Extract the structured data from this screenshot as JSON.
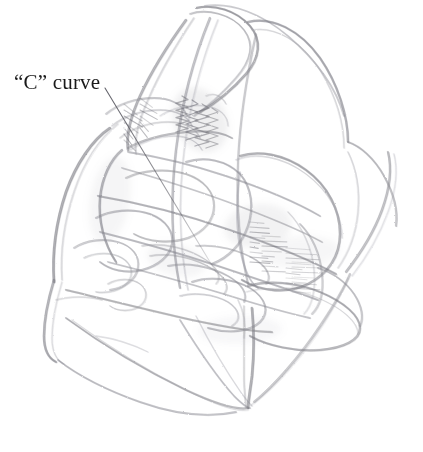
{
  "figure": {
    "type": "pencil-sketch",
    "medium": "graphite pencil on white paper",
    "background_color": "#ffffff",
    "stroke_colors": {
      "light": "#c9c9cf",
      "mid": "#9a9aa2",
      "dark": "#6a6a72",
      "darkest": "#55555d"
    }
  },
  "annotation": {
    "label": "“C” curve",
    "text_color": "#1a1a1a",
    "font_size_px": 21,
    "leader_line": {
      "from": [
        105,
        88
      ],
      "to": [
        216,
        272
      ],
      "color": "#5a5a62"
    }
  },
  "strokes": {
    "note": "Each entry is a graphite stroke path: d = SVG path, w = stroke width, o = opacity, c = color key",
    "paths": [
      {
        "d": "M196 8 C 214 4, 236 10, 250 26 C 262 40, 260 58, 246 74 C 232 90, 214 104, 200 112",
        "w": 2.1,
        "o": 0.55,
        "c": "#7a7a82"
      },
      {
        "d": "M190 14 C 206 8, 232 14, 244 30 C 256 46, 250 62, 236 78 C 222 94, 206 108, 194 116",
        "w": 1.6,
        "o": 0.45,
        "c": "#8a8a92"
      },
      {
        "d": "M205 6 C 232 2, 262 14, 288 36 C 316 60, 336 88, 344 116",
        "w": 1.8,
        "o": 0.4,
        "c": "#9a9aa2"
      },
      {
        "d": "M248 22 C 272 16, 300 30, 320 58 C 338 84, 348 116, 348 142",
        "w": 2.2,
        "o": 0.5,
        "c": "#7d7d85"
      },
      {
        "d": "M252 30 C 276 26, 302 42, 320 70 C 336 96, 344 124, 344 148",
        "w": 1.4,
        "o": 0.35,
        "c": "#a5a5ad"
      },
      {
        "d": "M186 20 C 170 42, 152 70, 140 96 C 130 118, 126 136, 128 150",
        "w": 2.4,
        "o": 0.5,
        "c": "#7b7b83"
      },
      {
        "d": "M194 18 C 178 42, 160 72, 148 100 C 138 122, 134 140, 136 154",
        "w": 1.5,
        "o": 0.38,
        "c": "#9b9ba3"
      },
      {
        "d": "M128 148 C 142 140, 164 134, 186 132 C 206 130, 222 132, 232 138",
        "w": 2.0,
        "o": 0.45,
        "c": "#84848c"
      },
      {
        "d": "M122 150 C 110 160, 102 178, 100 198 C 98 220, 104 244, 116 262",
        "w": 2.2,
        "o": 0.5,
        "c": "#7a7a82"
      },
      {
        "d": "M110 128 C 92 140, 76 164, 66 192 C 56 222, 52 254, 54 282",
        "w": 2.6,
        "o": 0.52,
        "c": "#77777f"
      },
      {
        "d": "M118 124 C 100 138, 84 162, 74 192 C 64 222, 60 252, 62 280",
        "w": 1.5,
        "o": 0.35,
        "c": "#9d9da5"
      },
      {
        "d": "M54 280 C 48 300, 44 320, 44 336 C 44 350, 48 358, 56 362",
        "w": 2.4,
        "o": 0.5,
        "c": "#7c7c84"
      },
      {
        "d": "M62 282 C 56 302, 52 322, 52 338 C 52 352, 56 360, 64 364",
        "w": 1.3,
        "o": 0.32,
        "c": "#a0a0a8"
      },
      {
        "d": "M58 360 C 76 374, 106 390, 140 402 C 174 414, 208 418, 236 412",
        "w": 1.9,
        "o": 0.42,
        "c": "#8b8b93"
      },
      {
        "d": "M66 318 C 96 340, 140 368, 186 390 C 216 404, 238 410, 248 408",
        "w": 2.0,
        "o": 0.45,
        "c": "#84848c"
      },
      {
        "d": "M72 320 C 102 342, 146 370, 190 392 C 218 406, 238 412, 248 410",
        "w": 1.2,
        "o": 0.3,
        "c": "#a8a8b0"
      },
      {
        "d": "M180 320 C 196 346, 216 376, 234 396 C 242 404, 248 408, 250 408",
        "w": 1.8,
        "o": 0.4,
        "c": "#8d8d95"
      },
      {
        "d": "M196 316 C 210 344, 228 374, 242 394 C 248 402, 252 406, 252 406",
        "w": 1.3,
        "o": 0.32,
        "c": "#a2a2aa"
      },
      {
        "d": "M252 308 C 254 330, 254 356, 252 376 C 250 392, 248 402, 248 408",
        "w": 2.6,
        "o": 0.5,
        "c": "#797981"
      },
      {
        "d": "M244 306 C 244 330, 244 356, 244 376 C 244 392, 246 402, 246 408",
        "w": 1.6,
        "o": 0.36,
        "c": "#9a9aa2"
      },
      {
        "d": "M254 402 C 274 386, 300 356, 320 326 C 336 302, 346 284, 350 274",
        "w": 2.0,
        "o": 0.42,
        "c": "#87878f"
      },
      {
        "d": "M250 406 C 270 392, 298 362, 318 332 C 334 308, 344 288, 348 278",
        "w": 1.3,
        "o": 0.3,
        "c": "#a4a4ac"
      },
      {
        "d": "M346 272 C 360 254, 374 232, 382 210 C 390 188, 392 168, 388 152",
        "w": 2.2,
        "o": 0.45,
        "c": "#82828a"
      },
      {
        "d": "M352 276 C 366 258, 380 234, 388 212 C 396 190, 398 170, 394 154",
        "w": 1.3,
        "o": 0.3,
        "c": "#a6a6ae"
      },
      {
        "d": "M348 142 C 360 146, 374 158, 384 176 C 394 194, 398 212, 396 226",
        "w": 2.0,
        "o": 0.42,
        "c": "#87878f"
      },
      {
        "d": "M128 152 C 154 156, 190 164, 226 176 C 262 188, 296 202, 320 216",
        "w": 2.0,
        "o": 0.4,
        "c": "#8a8a92"
      },
      {
        "d": "M122 168 C 150 176, 190 188, 228 202 C 266 216, 300 230, 322 242",
        "w": 1.8,
        "o": 0.38,
        "c": "#8e8e96"
      },
      {
        "d": "M98 196 C 134 202, 184 214, 230 230 C 276 246, 314 262, 336 274",
        "w": 2.2,
        "o": 0.45,
        "c": "#82828a"
      },
      {
        "d": "M100 232 C 132 240, 176 252, 218 266 C 260 280, 296 292, 318 300",
        "w": 2.0,
        "o": 0.42,
        "c": "#86868e"
      },
      {
        "d": "M108 262 C 140 270, 184 282, 224 294 C 262 306, 292 314, 310 318",
        "w": 1.8,
        "o": 0.4,
        "c": "#8c8c94"
      },
      {
        "d": "M66 290 C 100 298, 148 310, 192 320 C 230 328, 258 332, 272 332",
        "w": 2.2,
        "o": 0.44,
        "c": "#838389"
      },
      {
        "d": "M210 18 C 196 52, 182 100, 176 150 C 170 200, 172 248, 180 288",
        "w": 2.2,
        "o": 0.44,
        "c": "#81818a"
      },
      {
        "d": "M218 20 C 204 54, 190 102, 184 152 C 178 202, 180 250, 188 290",
        "w": 1.4,
        "o": 0.32,
        "c": "#a0a0a8"
      },
      {
        "d": "M256 34 C 248 70, 240 116, 238 162 C 236 208, 240 250, 248 284",
        "w": 1.9,
        "o": 0.4,
        "c": "#8a8a92"
      },
      {
        "d": "M240 156 C 258 150, 284 154, 306 170 C 328 186, 340 210, 340 234 C 340 256, 328 274, 308 284 C 288 294, 262 292, 242 280",
        "w": 2.3,
        "o": 0.48,
        "c": "#7c7c84"
      },
      {
        "d": "M236 160 C 254 152, 282 156, 306 174 C 330 192, 342 216, 342 238",
        "w": 1.4,
        "o": 0.32,
        "c": "#a2a2aa"
      },
      {
        "d": "M240 172 C 236 200, 236 232, 242 258 C 246 274, 252 284, 258 288",
        "w": 1.7,
        "o": 0.38,
        "c": "#90909a"
      },
      {
        "d": "M186 162 C 204 156, 226 160, 240 174 C 252 188, 254 208, 248 226 C 242 244, 228 258, 212 264",
        "w": 2.0,
        "o": 0.42,
        "c": "#86868e"
      },
      {
        "d": "M126 178 C 142 170, 166 168, 186 174 C 204 180, 214 192, 214 206 C 214 220, 204 232, 188 238 C 170 244, 148 242, 134 234",
        "w": 1.9,
        "o": 0.4,
        "c": "#89898f"
      },
      {
        "d": "M96 218 C 110 210, 132 208, 150 214 C 166 220, 174 232, 172 244 C 170 256, 158 266, 142 270 C 126 274, 110 270, 100 262",
        "w": 2.0,
        "o": 0.42,
        "c": "#86868e"
      },
      {
        "d": "M74 248 C 86 240, 104 238, 118 242 C 132 246, 140 256, 138 268 C 136 280, 124 288, 110 290",
        "w": 1.8,
        "o": 0.4,
        "c": "#8c8c94"
      },
      {
        "d": "M84 258 C 96 252, 112 252, 122 258 C 132 264, 134 274, 128 282 C 122 290, 108 294, 96 292",
        "w": 1.5,
        "o": 0.35,
        "c": "#989aa0"
      },
      {
        "d": "M108 284 C 118 278, 132 278, 140 284 C 148 290, 148 300, 140 306 C 132 312, 118 312, 110 306",
        "w": 1.5,
        "o": 0.35,
        "c": "#98989e"
      },
      {
        "d": "M248 286 C 268 280, 296 282, 320 292 C 344 302, 360 316, 360 328 C 360 340, 344 348, 320 350 C 296 352, 268 346, 250 336",
        "w": 2.2,
        "o": 0.46,
        "c": "#7e7e86"
      },
      {
        "d": "M246 292 C 266 286, 294 288, 318 298 C 342 308, 358 322, 358 334",
        "w": 1.3,
        "o": 0.3,
        "c": "#a4a4ac"
      },
      {
        "d": "M192 282 C 208 276, 232 278, 250 288 C 266 298, 270 312, 260 322 C 250 332, 228 334, 208 328",
        "w": 1.9,
        "o": 0.42,
        "c": "#87878f"
      },
      {
        "d": "M180 296 C 194 292, 214 294, 228 302 C 240 310, 242 320, 232 326",
        "w": 1.6,
        "o": 0.36,
        "c": "#94949c"
      },
      {
        "d": "M168 266 C 186 262, 210 266, 228 276 C 242 284, 248 294, 244 302",
        "w": 1.8,
        "o": 0.4,
        "c": "#8c8c94"
      },
      {
        "d": "M150 256 C 170 252, 196 258, 214 270 C 226 278, 230 288, 224 294",
        "w": 1.6,
        "o": 0.36,
        "c": "#949499"
      },
      {
        "d": "M142 246 C 162 242, 188 248, 206 260 C 218 268, 222 278, 216 284",
        "w": 1.5,
        "o": 0.34,
        "c": "#98989e"
      },
      {
        "d": "M196 246 C 216 244, 240 250, 256 260 C 268 268, 272 278, 266 284",
        "w": 1.7,
        "o": 0.38,
        "c": "#8e8e96"
      },
      {
        "d": "M106 114 C 118 104, 136 98, 154 98 C 170 98, 182 104, 186 114",
        "w": 1.8,
        "o": 0.4,
        "c": "#8c8c94"
      },
      {
        "d": "M112 126 C 124 116, 142 110, 160 110 C 176 110, 188 116, 192 126",
        "w": 1.6,
        "o": 0.36,
        "c": "#93939b"
      },
      {
        "d": "M120 138 C 132 128, 150 122, 168 122 C 184 122, 196 128, 200 138",
        "w": 1.5,
        "o": 0.34,
        "c": "#98989e"
      },
      {
        "d": "M130 150 C 142 142, 158 136, 174 136 C 188 136, 198 142, 202 150",
        "w": 1.4,
        "o": 0.32,
        "c": "#9d9da5"
      },
      {
        "d": "M160 116 C 172 108, 190 104, 206 106 C 220 108, 228 116, 228 126",
        "w": 1.3,
        "o": 0.3,
        "c": "#a0a0a8"
      },
      {
        "d": "M300 224 C 312 236, 320 254, 322 274 C 324 292, 320 306, 312 314",
        "w": 1.8,
        "o": 0.38,
        "c": "#8e8e96"
      },
      {
        "d": "M288 212 C 302 226, 312 248, 314 270 C 316 290, 312 306, 304 314",
        "w": 1.4,
        "o": 0.3,
        "c": "#a2a2aa"
      },
      {
        "d": "M318 268 C 332 272, 346 282, 354 294 C 362 306, 364 318, 360 326",
        "w": 1.9,
        "o": 0.4,
        "c": "#8a8a92"
      },
      {
        "d": "M348 152 C 356 168, 360 190, 358 212 C 356 234, 348 254, 338 268",
        "w": 1.5,
        "o": 0.32,
        "c": "#9e9ea6"
      },
      {
        "d": "M206 96 C 214 92, 222 96, 226 104",
        "w": 1.4,
        "o": 0.3,
        "c": "#9b9ba3"
      },
      {
        "d": "M56 300 C 70 296, 88 296, 102 300",
        "w": 1.4,
        "o": 0.3,
        "c": "#9e9ea6"
      },
      {
        "d": "M96 336 C 112 338, 132 344, 148 352",
        "w": 1.3,
        "o": 0.28,
        "c": "#a4a4ac"
      },
      {
        "d": "M238 300 C 244 312, 246 326, 244 338",
        "w": 1.4,
        "o": 0.3,
        "c": "#9e9ea6"
      }
    ],
    "hatch_zigzags": [
      {
        "x": 182,
        "y": 96,
        "h": 36,
        "amp": 6,
        "n": 5,
        "o": 0.5
      },
      {
        "x": 192,
        "y": 100,
        "h": 40,
        "amp": 6,
        "n": 5,
        "o": 0.55
      },
      {
        "x": 202,
        "y": 104,
        "h": 42,
        "amp": 7,
        "n": 5,
        "o": 0.5
      },
      {
        "x": 212,
        "y": 108,
        "h": 40,
        "amp": 6,
        "n": 5,
        "o": 0.45
      }
    ],
    "hatch_combs": [
      {
        "x": 124,
        "y": 104,
        "len": 22,
        "n": 7,
        "ang": 30,
        "o": 0.5,
        "sp": 6
      },
      {
        "x": 140,
        "y": 98,
        "len": 20,
        "n": 6,
        "ang": 28,
        "o": 0.45,
        "sp": 6
      },
      {
        "x": 250,
        "y": 222,
        "len": 20,
        "n": 9,
        "ang": 4,
        "o": 0.45,
        "sp": 5
      },
      {
        "x": 262,
        "y": 236,
        "len": 26,
        "n": 8,
        "ang": 2,
        "o": 0.4,
        "sp": 5
      },
      {
        "x": 286,
        "y": 248,
        "len": 34,
        "n": 9,
        "ang": 3,
        "o": 0.32,
        "sp": 5
      },
      {
        "x": 292,
        "y": 262,
        "len": 30,
        "n": 7,
        "ang": 2,
        "o": 0.28,
        "sp": 5
      }
    ],
    "shading_blobs": [
      {
        "cx": 200,
        "cy": 120,
        "rx": 26,
        "ry": 34,
        "rot": -28,
        "o": 0.16
      },
      {
        "cx": 258,
        "cy": 226,
        "rx": 34,
        "ry": 22,
        "rot": -8,
        "o": 0.13
      },
      {
        "cx": 110,
        "cy": 200,
        "rx": 20,
        "ry": 44,
        "rot": 10,
        "o": 0.1
      },
      {
        "cx": 300,
        "cy": 252,
        "rx": 40,
        "ry": 16,
        "rot": -4,
        "o": 0.09
      },
      {
        "cx": 176,
        "cy": 260,
        "rx": 30,
        "ry": 16,
        "rot": 14,
        "o": 0.1
      },
      {
        "cx": 240,
        "cy": 330,
        "rx": 42,
        "ry": 14,
        "rot": -2,
        "o": 0.08
      }
    ]
  }
}
